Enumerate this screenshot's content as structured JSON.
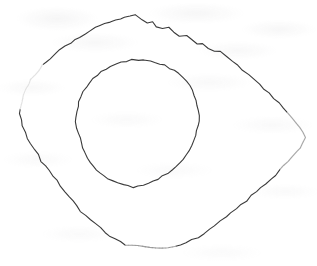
{
  "document": {
    "kind": "scanned-drawing",
    "title": "Two nested hand-drawn closed contours",
    "background_color": "#ffffff",
    "width": 317,
    "height": 266,
    "caption": "",
    "visible_text": [],
    "notes": "No legible text is rendered in the image; only faint scanner bleed-through ghosting."
  },
  "figure": {
    "name": "nested-contours",
    "stroke_color": "#3a3a3a",
    "faint_stroke_color": "#8f8f96",
    "stroke_width": 1.1,
    "shapes": [
      {
        "id": "outer-contour",
        "label": "outer contour",
        "closed": true,
        "bbox": {
          "x": 20,
          "y": 14,
          "width": 286,
          "height": 236
        },
        "style": "solid-with-faded-segments",
        "points": [
          [
            135,
            15
          ],
          [
            142,
            19
          ],
          [
            147,
            23
          ],
          [
            152,
            21
          ],
          [
            157,
            26
          ],
          [
            163,
            29
          ],
          [
            168,
            28
          ],
          [
            174,
            33
          ],
          [
            180,
            36
          ],
          [
            186,
            35
          ],
          [
            191,
            40
          ],
          [
            197,
            44
          ],
          [
            203,
            43
          ],
          [
            209,
            48
          ],
          [
            215,
            52
          ],
          [
            220,
            51
          ],
          [
            226,
            56
          ],
          [
            232,
            61
          ],
          [
            238,
            65
          ],
          [
            243,
            70
          ],
          [
            249,
            75
          ],
          [
            254,
            80
          ],
          [
            259,
            84
          ],
          [
            264,
            89
          ],
          [
            269,
            93
          ],
          [
            274,
            98
          ],
          [
            279,
            103
          ],
          [
            283,
            108
          ],
          [
            288,
            113
          ],
          [
            292,
            118
          ],
          [
            296,
            123
          ],
          [
            300,
            128
          ],
          [
            303,
            133
          ],
          [
            305,
            138
          ],
          [
            303,
            143
          ],
          [
            300,
            148
          ],
          [
            296,
            152
          ],
          [
            292,
            157
          ],
          [
            288,
            161
          ],
          [
            284,
            166
          ],
          [
            280,
            170
          ],
          [
            276,
            175
          ],
          [
            271,
            179
          ],
          [
            266,
            184
          ],
          [
            261,
            188
          ],
          [
            256,
            192
          ],
          [
            251,
            196
          ],
          [
            246,
            201
          ],
          [
            241,
            205
          ],
          [
            236,
            209
          ],
          [
            231,
            213
          ],
          [
            226,
            217
          ],
          [
            221,
            221
          ],
          [
            215,
            225
          ],
          [
            210,
            229
          ],
          [
            204,
            233
          ],
          [
            198,
            237
          ],
          [
            192,
            240
          ],
          [
            186,
            243
          ],
          [
            180,
            245
          ],
          [
            174,
            246
          ],
          [
            168,
            247
          ],
          [
            162,
            248
          ],
          [
            156,
            248
          ],
          [
            150,
            247
          ],
          [
            144,
            246
          ],
          [
            138,
            246
          ],
          [
            132,
            246
          ],
          [
            126,
            245
          ],
          [
            120,
            242
          ],
          [
            115,
            239
          ],
          [
            110,
            236
          ],
          [
            105,
            232
          ],
          [
            100,
            228
          ],
          [
            95,
            224
          ],
          [
            90,
            220
          ],
          [
            86,
            215
          ],
          [
            81,
            211
          ],
          [
            77,
            206
          ],
          [
            73,
            201
          ],
          [
            69,
            196
          ],
          [
            65,
            191
          ],
          [
            61,
            186
          ],
          [
            57,
            181
          ],
          [
            53,
            176
          ],
          [
            49,
            171
          ],
          [
            45,
            166
          ],
          [
            41,
            161
          ],
          [
            38,
            155
          ],
          [
            34,
            150
          ],
          [
            31,
            144
          ],
          [
            28,
            138
          ],
          [
            25,
            132
          ],
          [
            23,
            126
          ],
          [
            21,
            120
          ],
          [
            20,
            114
          ],
          [
            21,
            108
          ],
          [
            22,
            102
          ],
          [
            23,
            96
          ],
          [
            25,
            90
          ],
          [
            28,
            85
          ],
          [
            31,
            80
          ],
          [
            35,
            75
          ],
          [
            39,
            71
          ],
          [
            43,
            66
          ],
          [
            47,
            62
          ],
          [
            51,
            58
          ],
          [
            56,
            54
          ],
          [
            60,
            50
          ],
          [
            65,
            46
          ],
          [
            70,
            43
          ],
          [
            75,
            40
          ],
          [
            80,
            37
          ],
          [
            85,
            34
          ],
          [
            90,
            31
          ],
          [
            95,
            28
          ],
          [
            100,
            26
          ],
          [
            105,
            24
          ],
          [
            110,
            22
          ],
          [
            115,
            20
          ],
          [
            120,
            19
          ],
          [
            125,
            17
          ],
          [
            130,
            16
          ]
        ],
        "faded_segments": [
          {
            "from_index": 28,
            "to_index": 40,
            "description": "right side fades to dotted"
          },
          {
            "from_index": 60,
            "to_index": 68,
            "description": "bottom-right fades to dotted"
          },
          {
            "from_index": 96,
            "to_index": 104,
            "description": "left side becomes light gray"
          }
        ]
      },
      {
        "id": "inner-contour",
        "label": "inner contour",
        "closed": true,
        "bbox": {
          "x": 76,
          "y": 59,
          "width": 124,
          "height": 130
        },
        "style": "solid",
        "points": [
          [
            138,
            60
          ],
          [
            144,
            60
          ],
          [
            150,
            61
          ],
          [
            155,
            62
          ],
          [
            160,
            64
          ],
          [
            165,
            65
          ],
          [
            170,
            68
          ],
          [
            175,
            71
          ],
          [
            179,
            74
          ],
          [
            183,
            78
          ],
          [
            187,
            82
          ],
          [
            190,
            86
          ],
          [
            192,
            91
          ],
          [
            194,
            96
          ],
          [
            196,
            101
          ],
          [
            197,
            106
          ],
          [
            198,
            111
          ],
          [
            199,
            116
          ],
          [
            199,
            121
          ],
          [
            198,
            126
          ],
          [
            197,
            131
          ],
          [
            196,
            136
          ],
          [
            194,
            141
          ],
          [
            192,
            146
          ],
          [
            189,
            150
          ],
          [
            186,
            155
          ],
          [
            183,
            159
          ],
          [
            180,
            163
          ],
          [
            176,
            167
          ],
          [
            172,
            170
          ],
          [
            168,
            173
          ],
          [
            163,
            176
          ],
          [
            158,
            179
          ],
          [
            153,
            181
          ],
          [
            148,
            183
          ],
          [
            143,
            185
          ],
          [
            138,
            186
          ],
          [
            133,
            187
          ],
          [
            128,
            186
          ],
          [
            123,
            185
          ],
          [
            118,
            183
          ],
          [
            113,
            181
          ],
          [
            108,
            179
          ],
          [
            104,
            176
          ],
          [
            100,
            173
          ],
          [
            96,
            170
          ],
          [
            93,
            166
          ],
          [
            90,
            162
          ],
          [
            87,
            158
          ],
          [
            85,
            153
          ],
          [
            83,
            148
          ],
          [
            81,
            143
          ],
          [
            80,
            138
          ],
          [
            78,
            133
          ],
          [
            77,
            128
          ],
          [
            76,
            122
          ],
          [
            76,
            117
          ],
          [
            77,
            111
          ],
          [
            78,
            106
          ],
          [
            79,
            101
          ],
          [
            81,
            96
          ],
          [
            83,
            91
          ],
          [
            86,
            87
          ],
          [
            89,
            83
          ],
          [
            93,
            79
          ],
          [
            97,
            75
          ],
          [
            101,
            72
          ],
          [
            106,
            69
          ],
          [
            111,
            66
          ],
          [
            116,
            64
          ],
          [
            121,
            62
          ],
          [
            127,
            61
          ],
          [
            132,
            60
          ]
        ],
        "faded_segments": []
      }
    ]
  }
}
